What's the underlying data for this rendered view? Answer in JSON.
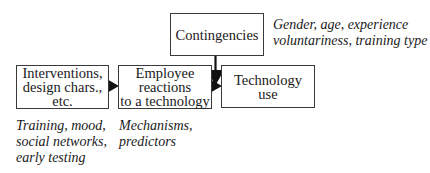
{
  "diagram": {
    "nodes": [
      {
        "id": "interventions",
        "label": "Interventions,\ndesign chars.,\netc.",
        "note": "Training, mood,\nsocial networks,\nearly testing"
      },
      {
        "id": "employee_reactions",
        "label": "Employee\nreactions\nto a technology",
        "note": "Mechanisms,\npredictors"
      },
      {
        "id": "contingencies",
        "label": "Contingencies",
        "note": "Gender, age, experience\nvoluntariness, training type"
      },
      {
        "id": "technology_use",
        "label": "Technology\nuse"
      }
    ],
    "edges": [
      {
        "from": "interventions",
        "to": "employee_reactions"
      },
      {
        "from": "employee_reactions",
        "to": "technology_use"
      },
      {
        "from": "contingencies",
        "to": "employee_reactions->technology_use"
      }
    ],
    "colors": {
      "stroke": "#3a3a3a",
      "arrow": "#111111",
      "background": "#ffffff"
    }
  }
}
